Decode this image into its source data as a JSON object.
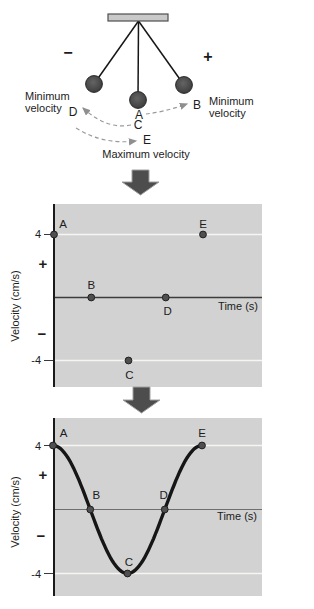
{
  "pendulum": {
    "sign_left": "−",
    "sign_right": "+",
    "caption_left_line1": "Minimum",
    "caption_left_line2": "velocity",
    "caption_right_line1": "Minimum",
    "caption_right_line2": "velocity",
    "caption_bottom": "Maximum velocity",
    "labels": {
      "A": "A",
      "B": "B",
      "C": "C",
      "D": "D",
      "E": "E"
    }
  },
  "graph": {
    "ylabel": "Velocity (cm/s)",
    "xlabel": "Time (s)",
    "ytick_top": "4",
    "ytick_bottom": "-4",
    "sign_plus": "+",
    "sign_minus": "−"
  },
  "colors": {
    "panel_background": "#d2d2d2",
    "gridline": "#f5f5f3",
    "point": "#4f4f4f",
    "curve": "#161616",
    "block_arrow": "#4d4d4d"
  },
  "chart_data": [
    {
      "type": "scatter",
      "title": "",
      "xlabel": "Time (s)",
      "ylabel": "Velocity (cm/s)",
      "yticks": [
        4,
        -4
      ],
      "ylim": [
        -5.8,
        5.8
      ],
      "gridlines_y": [
        4,
        -4
      ],
      "legend": "none",
      "points": [
        {
          "label": "A",
          "t": 0,
          "velocity": 4
        },
        {
          "label": "B",
          "t": 1,
          "velocity": 0
        },
        {
          "label": "C",
          "t": 2,
          "velocity": -4
        },
        {
          "label": "D",
          "t": 3,
          "velocity": 0
        },
        {
          "label": "E",
          "t": 4,
          "velocity": 4
        }
      ]
    },
    {
      "type": "line",
      "title": "",
      "xlabel": "Time (s)",
      "ylabel": "Velocity (cm/s)",
      "yticks": [
        4,
        -4
      ],
      "ylim": [
        -5.6,
        5.6
      ],
      "gridlines_y": [
        4,
        -4
      ],
      "legend": "none",
      "curve": {
        "shape": "cosine",
        "amplitude": 4,
        "period": 4
      },
      "points": [
        {
          "label": "A",
          "t": 0,
          "velocity": 4
        },
        {
          "label": "B",
          "t": 1,
          "velocity": 0
        },
        {
          "label": "C",
          "t": 2,
          "velocity": -4
        },
        {
          "label": "D",
          "t": 3,
          "velocity": 0
        },
        {
          "label": "E",
          "t": 4,
          "velocity": 4
        }
      ]
    }
  ]
}
